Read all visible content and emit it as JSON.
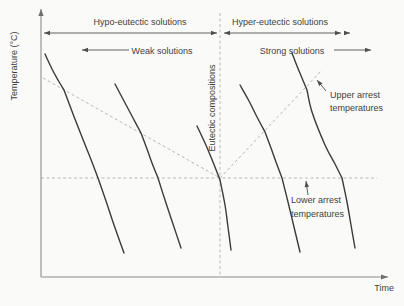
{
  "figure": {
    "y_axis_label": "Temperature (°C)",
    "x_axis_label": "Time"
  },
  "labels": {
    "hypo": "Hypo-eutectic solutions",
    "hyper": "Hyper-eutectic solutions",
    "weak": "Weak solutions",
    "strong": "Strong solutions",
    "eutectic": "Eutectic compositions",
    "upper_arrest": [
      "Upper arrest",
      "temperatures"
    ],
    "lower_arrest": [
      "Lower arrest",
      "temperatures"
    ]
  },
  "colors": {
    "curve": "#3b3b3b",
    "dashed_guide": "#b9b9b9",
    "axis": "#8c8c8c",
    "annotation_arrow": "#4e4e4e",
    "text": "#3e3e3e",
    "background": "#fafaf8"
  },
  "chart_data": {
    "type": "line",
    "xlabel": "Time",
    "ylabel": "Temperature (°C)",
    "axes_quantitative": false,
    "legend": "none",
    "curves": [
      {
        "name": "cooling-curve-hypo-1",
        "role": "hypo-eutectic weak solution",
        "segments": [
          [
            [
              45,
              54
            ],
            [
              52,
              69
            ],
            [
              58,
              80
            ],
            [
              64,
              90
            ]
          ],
          [
            [
              64,
              90
            ],
            [
              73,
              114
            ],
            [
              82,
              137
            ],
            [
              90,
              157
            ],
            [
              98,
              178
            ]
          ],
          [
            [
              98,
              178
            ],
            [
              106,
              201
            ],
            [
              114,
              225
            ],
            [
              124,
              253
            ]
          ]
        ]
      },
      {
        "name": "cooling-curve-hypo-2",
        "role": "hypo-eutectic weak solution",
        "segments": [
          [
            [
              115,
              84
            ],
            [
              124,
              101
            ],
            [
              133,
              118
            ],
            [
              141,
              133
            ]
          ],
          [
            [
              141,
              133
            ],
            [
              147,
              149
            ],
            [
              152,
              163
            ],
            [
              158,
              178
            ]
          ],
          [
            [
              158,
              178
            ],
            [
              165,
              200
            ],
            [
              173,
              224
            ],
            [
              181,
              248
            ]
          ]
        ]
      },
      {
        "name": "cooling-curve-eutectic",
        "role": "eutectic composition",
        "segments": [
          [
            [
              197,
              126
            ],
            [
              205,
              143
            ],
            [
              213,
              162
            ],
            [
              220,
              180
            ]
          ],
          [
            [
              220,
              180
            ],
            [
              225,
              205
            ],
            [
              228,
              227
            ],
            [
              231,
              250
            ]
          ]
        ]
      },
      {
        "name": "cooling-curve-hyper-1",
        "role": "hyper-eutectic strong solution",
        "segments": [
          [
            [
              240,
              85
            ],
            [
              249,
              101
            ],
            [
              257,
              117
            ],
            [
              265,
              132
            ]
          ],
          [
            [
              265,
              132
            ],
            [
              271,
              148
            ],
            [
              276,
              162
            ],
            [
              282,
              178
            ]
          ],
          [
            [
              282,
              178
            ],
            [
              288,
              202
            ],
            [
              294,
              227
            ],
            [
              300,
              252
            ]
          ]
        ]
      },
      {
        "name": "cooling-curve-hyper-2",
        "role": "hyper-eutectic strong solution",
        "segments": [
          [
            [
              292,
              53
            ],
            [
              297,
              66
            ],
            [
              302,
              78
            ],
            [
              307,
              90
            ]
          ],
          [
            [
              307,
              90
            ],
            [
              312,
              112
            ],
            [
              325,
              145
            ],
            [
              335,
              164
            ],
            [
              342,
              178
            ]
          ],
          [
            [
              342,
              178
            ],
            [
              347,
              202
            ],
            [
              351,
              225
            ],
            [
              355,
              248
            ]
          ]
        ]
      }
    ],
    "guides": [
      {
        "name": "eutectic-composition-guide",
        "pts": [
          [
            220,
            13
          ],
          [
            220,
            277
          ]
        ]
      },
      {
        "name": "lower-arrest-temperature-guide",
        "pts": [
          [
            41,
            178
          ],
          [
            377,
            178
          ]
        ]
      },
      {
        "name": "upper-arrest-guide-hypo",
        "pts": [
          [
            43,
            78
          ],
          [
            220,
            178
          ]
        ]
      },
      {
        "name": "upper-arrest-guide-hyper",
        "pts": [
          [
            220,
            178
          ],
          [
            322,
            70
          ]
        ]
      }
    ],
    "axes": [
      {
        "name": "y-axis",
        "from": [
          41,
          277
        ],
        "to": [
          41,
          9
        ]
      },
      {
        "name": "x-axis",
        "from": [
          41,
          277
        ],
        "to": [
          388,
          277
        ]
      }
    ],
    "arrows": [
      {
        "name": "hypo-span-arrow",
        "from": [
          44,
          33
        ],
        "to": [
          217,
          33
        ],
        "heads": "both"
      },
      {
        "name": "hyper-span-arrow",
        "from": [
          224,
          33
        ],
        "to": [
          341,
          33
        ],
        "heads": "both"
      },
      {
        "name": "hyper-span-arrow-extra-head",
        "from": [
          344,
          33
        ],
        "to": [
          350,
          33
        ],
        "heads": "end"
      },
      {
        "name": "weak-solutions-arrow",
        "from": [
          129,
          50
        ],
        "to": [
          82,
          50
        ],
        "heads": "end"
      },
      {
        "name": "strong-solutions-arrow",
        "from": [
          334,
          50
        ],
        "to": [
          371,
          50
        ],
        "heads": "end"
      },
      {
        "name": "upper-arrest-pointer-arrow",
        "from": [
          326,
          91
        ],
        "to": [
          317,
          80
        ],
        "heads": "end"
      },
      {
        "name": "lower-arrest-pointer-arrow",
        "from": [
          308,
          195
        ],
        "to": [
          306,
          181
        ],
        "heads": "end"
      }
    ]
  }
}
